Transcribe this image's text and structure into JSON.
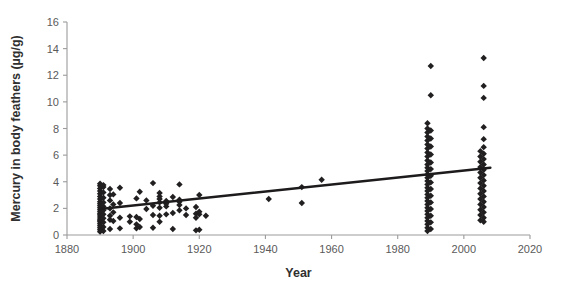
{
  "chart_data": {
    "type": "scatter",
    "title": "",
    "xlabel": "Year",
    "ylabel": "Mercury in body feathers (µg/g)",
    "xlim": [
      1880,
      2020
    ],
    "ylim": [
      0,
      16
    ],
    "xticks": [
      1880,
      1900,
      1920,
      1940,
      1960,
      1980,
      2000,
      2020
    ],
    "yticks": [
      0,
      2,
      4,
      6,
      8,
      10,
      12,
      14,
      16
    ],
    "grid": false,
    "legend": null,
    "marker": "diamond",
    "marker_color": "#211f1f",
    "axis_color": "#9b9b9b",
    "series": [
      {
        "name": "Mercury in body feathers",
        "points": [
          [
            1890,
            0.25
          ],
          [
            1890,
            0.4
          ],
          [
            1890,
            0.55
          ],
          [
            1890,
            0.7
          ],
          [
            1890,
            0.85
          ],
          [
            1890,
            1.0
          ],
          [
            1890,
            1.1
          ],
          [
            1890,
            1.2
          ],
          [
            1890,
            1.35
          ],
          [
            1890,
            1.5
          ],
          [
            1890,
            1.6
          ],
          [
            1890,
            1.75
          ],
          [
            1890,
            1.9
          ],
          [
            1890,
            2.05
          ],
          [
            1890,
            2.2
          ],
          [
            1890,
            2.35
          ],
          [
            1890,
            2.5
          ],
          [
            1890,
            2.7
          ],
          [
            1890,
            2.9
          ],
          [
            1890,
            3.1
          ],
          [
            1890,
            3.3
          ],
          [
            1890,
            3.5
          ],
          [
            1890,
            3.7
          ],
          [
            1890,
            3.85
          ],
          [
            1891,
            0.3
          ],
          [
            1891,
            0.6
          ],
          [
            1891,
            0.95
          ],
          [
            1891,
            1.25
          ],
          [
            1891,
            1.55
          ],
          [
            1891,
            1.85
          ],
          [
            1891,
            2.15
          ],
          [
            1891,
            2.45
          ],
          [
            1891,
            2.8
          ],
          [
            1891,
            3.2
          ],
          [
            1891,
            3.6
          ],
          [
            1891,
            3.75
          ],
          [
            1893,
            0.45
          ],
          [
            1893,
            1.15
          ],
          [
            1893,
            1.45
          ],
          [
            1893,
            2.0
          ],
          [
            1893,
            2.6
          ],
          [
            1893,
            3.0
          ],
          [
            1893,
            3.45
          ],
          [
            1894,
            1.05
          ],
          [
            1894,
            1.7
          ],
          [
            1894,
            2.3
          ],
          [
            1894,
            3.05
          ],
          [
            1896,
            0.5
          ],
          [
            1896,
            1.3
          ],
          [
            1896,
            2.4
          ],
          [
            1896,
            3.55
          ],
          [
            1899,
            1.0
          ],
          [
            1899,
            1.4
          ],
          [
            1901,
            0.5
          ],
          [
            1901,
            0.8
          ],
          [
            1901,
            1.35
          ],
          [
            1901,
            2.75
          ],
          [
            1902,
            0.6
          ],
          [
            1902,
            1.2
          ],
          [
            1902,
            3.25
          ],
          [
            1904,
            1.95
          ],
          [
            1904,
            2.6
          ],
          [
            1906,
            0.55
          ],
          [
            1906,
            1.5
          ],
          [
            1906,
            2.2
          ],
          [
            1906,
            3.9
          ],
          [
            1908,
            1.0
          ],
          [
            1908,
            1.45
          ],
          [
            1908,
            2.05
          ],
          [
            1908,
            2.45
          ],
          [
            1908,
            2.7
          ],
          [
            1908,
            2.9
          ],
          [
            1908,
            3.15
          ],
          [
            1910,
            1.55
          ],
          [
            1910,
            2.15
          ],
          [
            1910,
            2.35
          ],
          [
            1910,
            2.55
          ],
          [
            1912,
            0.45
          ],
          [
            1912,
            1.65
          ],
          [
            1912,
            2.85
          ],
          [
            1914,
            1.85
          ],
          [
            1914,
            2.25
          ],
          [
            1914,
            2.5
          ],
          [
            1914,
            2.65
          ],
          [
            1914,
            3.8
          ],
          [
            1916,
            1.5
          ],
          [
            1916,
            2.0
          ],
          [
            1919,
            0.35
          ],
          [
            1919,
            1.3
          ],
          [
            1919,
            1.6
          ],
          [
            1919,
            2.1
          ],
          [
            1920,
            0.4
          ],
          [
            1920,
            1.55
          ],
          [
            1920,
            1.75
          ],
          [
            1920,
            3.0
          ],
          [
            1922,
            1.45
          ],
          [
            1941,
            2.7
          ],
          [
            1951,
            2.4
          ],
          [
            1951,
            3.6
          ],
          [
            1957,
            4.15
          ],
          [
            1989,
            0.3
          ],
          [
            1989,
            0.55
          ],
          [
            1989,
            0.8
          ],
          [
            1989,
            1.05
          ],
          [
            1989,
            1.3
          ],
          [
            1989,
            1.55
          ],
          [
            1989,
            1.8
          ],
          [
            1989,
            2.05
          ],
          [
            1989,
            2.3
          ],
          [
            1989,
            2.55
          ],
          [
            1989,
            2.8
          ],
          [
            1989,
            3.05
          ],
          [
            1989,
            3.3
          ],
          [
            1989,
            3.55
          ],
          [
            1989,
            3.8
          ],
          [
            1989,
            4.05
          ],
          [
            1989,
            4.3
          ],
          [
            1989,
            4.55
          ],
          [
            1989,
            4.8
          ],
          [
            1989,
            5.05
          ],
          [
            1989,
            5.3
          ],
          [
            1989,
            5.6
          ],
          [
            1989,
            5.9
          ],
          [
            1989,
            6.2
          ],
          [
            1989,
            6.5
          ],
          [
            1989,
            6.8
          ],
          [
            1989,
            7.1
          ],
          [
            1989,
            7.4
          ],
          [
            1989,
            7.7
          ],
          [
            1989,
            8.0
          ],
          [
            1989,
            8.4
          ],
          [
            1990,
            0.45
          ],
          [
            1990,
            0.95
          ],
          [
            1990,
            1.45
          ],
          [
            1990,
            1.95
          ],
          [
            1990,
            2.45
          ],
          [
            1990,
            2.95
          ],
          [
            1990,
            3.45
          ],
          [
            1990,
            3.95
          ],
          [
            1990,
            4.45
          ],
          [
            1990,
            4.95
          ],
          [
            1990,
            5.45
          ],
          [
            1990,
            6.05
          ],
          [
            1990,
            6.65
          ],
          [
            1990,
            7.25
          ],
          [
            1990,
            7.85
          ],
          [
            1990,
            10.5
          ],
          [
            1990,
            12.7
          ],
          [
            2005,
            1.1
          ],
          [
            2005,
            1.5
          ],
          [
            2005,
            1.9
          ],
          [
            2005,
            2.3
          ],
          [
            2005,
            2.7
          ],
          [
            2005,
            3.1
          ],
          [
            2005,
            3.5
          ],
          [
            2005,
            3.9
          ],
          [
            2005,
            4.3
          ],
          [
            2005,
            4.7
          ],
          [
            2005,
            5.1
          ],
          [
            2005,
            5.5
          ],
          [
            2005,
            5.9
          ],
          [
            2005,
            6.3
          ],
          [
            2006,
            1.0
          ],
          [
            2006,
            1.3
          ],
          [
            2006,
            1.7
          ],
          [
            2006,
            2.1
          ],
          [
            2006,
            2.5
          ],
          [
            2006,
            2.9
          ],
          [
            2006,
            3.3
          ],
          [
            2006,
            3.7
          ],
          [
            2006,
            4.1
          ],
          [
            2006,
            4.5
          ],
          [
            2006,
            4.9
          ],
          [
            2006,
            5.3
          ],
          [
            2006,
            5.7
          ],
          [
            2006,
            6.1
          ],
          [
            2006,
            6.6
          ],
          [
            2006,
            7.2
          ],
          [
            2006,
            8.1
          ],
          [
            2006,
            10.3
          ],
          [
            2006,
            11.2
          ],
          [
            2006,
            13.3
          ]
        ]
      }
    ],
    "trendline": {
      "name": "linear-fit",
      "x": [
        1890,
        2008
      ],
      "y": [
        1.95,
        5.05
      ]
    }
  }
}
